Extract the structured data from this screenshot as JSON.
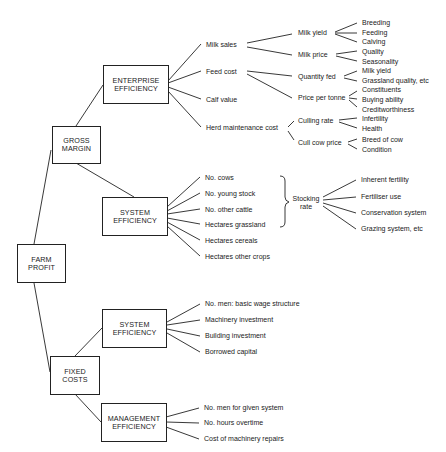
{
  "diagram": {
    "root": {
      "line1": "FARM",
      "line2": "PROFIT"
    },
    "gross_margin": {
      "line1": "GROSS",
      "line2": "MARGIN",
      "enterprise_efficiency": {
        "line1": "ENTERPRISE",
        "line2": "EFFICIENCY",
        "items": [
          "Milk sales",
          "Feed cost",
          "Calf value",
          "Herd maintenance cost"
        ],
        "milk_sales": {
          "milk_yield": {
            "label": "Milk yield",
            "children": [
              "Breeding",
              "Feeding",
              "Calving"
            ]
          },
          "milk_price": {
            "label": "Milk price",
            "children": [
              "Quality",
              "Seasonality"
            ]
          }
        },
        "feed_cost": {
          "quantity_fed": {
            "label": "Quantity fed",
            "children": [
              "Milk yield",
              "Grassland quality, etc"
            ]
          },
          "price_per_tonne": {
            "label": "Price per tonne",
            "children": [
              "Constituents",
              "Buying ability",
              "Creditworthiness"
            ]
          }
        },
        "herd_maintenance": {
          "culling_rate": {
            "label": "Culling rate",
            "children": [
              "Infertility",
              "Health"
            ]
          },
          "cull_cow_price": {
            "label": "Cull cow price",
            "children": [
              "Breed of cow",
              "Condition"
            ]
          }
        }
      },
      "system_efficiency": {
        "line1": "SYSTEM",
        "line2": "EFFICIENCY",
        "items": [
          "No. cows",
          "No. young stock",
          "No. other cattle",
          "Hectares grassland",
          "Hectares cereals",
          "Hectares other crops"
        ],
        "stocking_rate": {
          "line1": "Stocking",
          "line2": "rate",
          "children": [
            "Inherent fertility",
            "Fertiliser use",
            "Conservation system",
            "Grazing system, etc"
          ]
        }
      }
    },
    "fixed_costs": {
      "line1": "FIXED",
      "line2": "COSTS",
      "system_efficiency": {
        "line1": "SYSTEM",
        "line2": "EFFICIENCY",
        "items": [
          "No. men: basic wage structure",
          "Machinery investment",
          "Building investment",
          "Borrowed capital"
        ]
      },
      "management_efficiency": {
        "line1": "MANAGEMENT",
        "line2": "EFFICIENCY",
        "items": [
          "No. men for given system",
          "No. hours overtime",
          "Cost of machinery repairs"
        ]
      }
    }
  }
}
